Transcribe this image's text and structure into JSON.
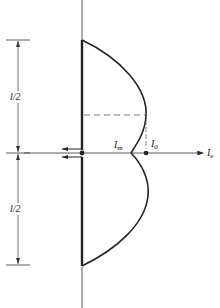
{
  "diagram": {
    "type": "antenna current distribution",
    "labels": {
      "upper_half": "l/2",
      "lower_half": "l/2",
      "i_m": {
        "main": "I",
        "sub": "m"
      },
      "i_0": {
        "main": "I",
        "sub": "0"
      },
      "i_e": {
        "main": "I",
        "sub": "e"
      }
    },
    "colors": {
      "line": "#222222",
      "background": "#ffffff"
    }
  }
}
